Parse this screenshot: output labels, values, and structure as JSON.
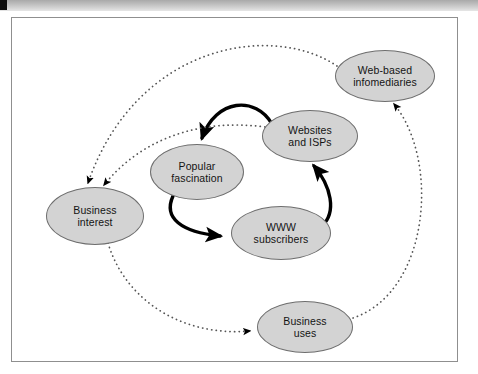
{
  "figure": {
    "type": "causal-loop-diagram",
    "title": "",
    "background_color": "#ffffff",
    "frame_border_color": "#8f8f8f",
    "node_fill_color": "#d3d3d3",
    "node_border_color": "#6e6e6e",
    "solid_link_color": "#000000",
    "dotted_link_color": "#555555"
  },
  "top_bar": {
    "marker_color": "#0d0d0d",
    "gradient_from": "#a9a9a9",
    "gradient_to": "#e6e6e6"
  },
  "nodes": [
    {
      "id": "business-interest",
      "label": "Business interest",
      "line1": "Business",
      "line2": "interest",
      "cx": 95,
      "cy": 216,
      "rx": 49,
      "ry": 29
    },
    {
      "id": "popular-fascination",
      "label": "Popular fascination",
      "line1": "Popular",
      "line2": "fascination",
      "cx": 197,
      "cy": 172,
      "rx": 47,
      "ry": 28
    },
    {
      "id": "websites-and-isps",
      "label": "Websites and ISPs",
      "line1": "Websites",
      "line2": "and ISPs",
      "cx": 310,
      "cy": 136,
      "rx": 48,
      "ry": 26
    },
    {
      "id": "www-subscribers",
      "label": "WWW subscribers",
      "line1": "WWW",
      "line2": "subscribers",
      "cx": 281,
      "cy": 233,
      "rx": 50,
      "ry": 27
    },
    {
      "id": "web-based-infomediaries",
      "label": "Web-based infomediaries",
      "line1": "Web-based",
      "line2": "infomediaries",
      "cx": 385,
      "cy": 76,
      "rx": 50,
      "ry": 26
    },
    {
      "id": "business-uses",
      "label": "Business uses",
      "line1": "Business",
      "line2": "uses",
      "cx": 305,
      "cy": 327,
      "rx": 48,
      "ry": 26
    }
  ],
  "links": [
    {
      "id": "websites-to-popular",
      "from": "websites-and-isps",
      "to": "popular-fascination",
      "style": "solid",
      "path": "M 272 124 C 256 96, 216 98, 202 138"
    },
    {
      "id": "popular-to-www",
      "from": "popular-fascination",
      "to": "www-subscribers",
      "style": "solid",
      "path": "M 173 196 C 163 218, 181 232, 220 236"
    },
    {
      "id": "www-to-websites",
      "from": "www-subscribers",
      "to": "websites-and-isps",
      "style": "solid",
      "path": "M 322 226 C 337 212, 331 186, 314 166"
    },
    {
      "id": "infomediaries-to-business-interest",
      "from": "web-based-infomediaries",
      "to": "business-interest",
      "style": "dotted",
      "path": "M 337 66 C 272 22, 136 44, 88 183"
    },
    {
      "id": "websites-to-business-interest",
      "from": "websites-and-isps",
      "to": "business-interest",
      "style": "dotted",
      "path": "M 265 127 C 198 118, 140 140, 104 185"
    },
    {
      "id": "business-interest-to-business-uses",
      "from": "business-interest",
      "to": "business-uses",
      "style": "dotted",
      "path": "M 108 243 C 125 300, 182 337, 250 331"
    },
    {
      "id": "business-uses-to-infomediaries",
      "from": "business-uses",
      "to": "web-based-infomediaries",
      "style": "dotted",
      "path": "M 353 318 C 430 292, 440 160, 394 104"
    }
  ]
}
